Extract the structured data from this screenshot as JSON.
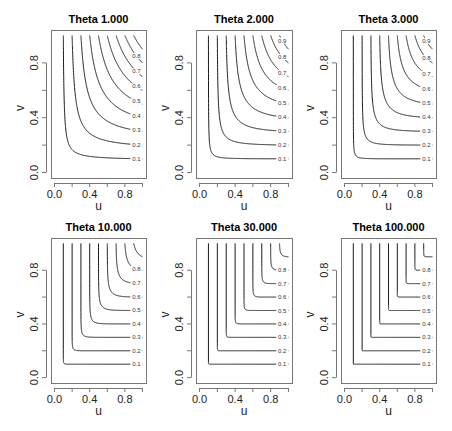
{
  "figure": {
    "width": 452,
    "height": 431,
    "line_color": "#1a1a1a",
    "frame_color": "#777777",
    "background": "#ffffff"
  },
  "chart_data": [
    {
      "type": "contour",
      "title": "Theta 1.000",
      "theta": 1,
      "xlabel": "u",
      "ylabel": "v",
      "xlim": [
        0,
        1
      ],
      "ylim": [
        0,
        1
      ],
      "xticks": [
        0.0,
        0.2,
        0.4,
        0.6,
        0.8,
        1.0
      ],
      "xtick_labels": [
        "0.0",
        "",
        "0.4",
        "",
        "0.8",
        ""
      ],
      "yticks": [
        0.0,
        0.2,
        0.4,
        0.6,
        0.8
      ],
      "ytick_labels": [
        "0.0",
        "",
        "0.4",
        "",
        "0.8"
      ],
      "levels": [
        0.1,
        0.2,
        0.3,
        0.4,
        0.5,
        0.6,
        0.7,
        0.8,
        0.9
      ],
      "level_labels": [
        "0.1",
        "0.2",
        "0.3",
        "0.4",
        "0.5",
        "0.6",
        "0.7",
        "0.8",
        ""
      ],
      "grid": false,
      "frame": {
        "x": 51,
        "y": 30,
        "w": 95,
        "h": 148
      }
    },
    {
      "type": "contour",
      "title": "Theta 2.000",
      "theta": 2,
      "xlabel": "u",
      "ylabel": "v",
      "xlim": [
        0,
        1
      ],
      "ylim": [
        0,
        1
      ],
      "xticks": [
        0.0,
        0.2,
        0.4,
        0.6,
        0.8,
        1.0
      ],
      "xtick_labels": [
        "0.0",
        "",
        "0.4",
        "",
        "0.8",
        ""
      ],
      "yticks": [
        0.0,
        0.2,
        0.4,
        0.6,
        0.8
      ],
      "ytick_labels": [
        "0.0",
        "",
        "0.4",
        "",
        "0.8"
      ],
      "levels": [
        0.1,
        0.2,
        0.3,
        0.4,
        0.5,
        0.6,
        0.7,
        0.8,
        0.9
      ],
      "level_labels": [
        "0.1",
        "0.2",
        "0.3",
        "0.4",
        "0.5",
        "0.6",
        "0.7",
        "0.8",
        "0.9"
      ],
      "grid": false,
      "frame": {
        "x": 196,
        "y": 30,
        "w": 96,
        "h": 148
      }
    },
    {
      "type": "contour",
      "title": "Theta 3.000",
      "theta": 3,
      "xlabel": "u",
      "ylabel": "v",
      "xlim": [
        0,
        1
      ],
      "ylim": [
        0,
        1
      ],
      "xticks": [
        0.0,
        0.2,
        0.4,
        0.6,
        0.8,
        1.0
      ],
      "xtick_labels": [
        "0.0",
        "",
        "0.4",
        "",
        "0.8",
        ""
      ],
      "yticks": [
        0.0,
        0.2,
        0.4,
        0.6,
        0.8
      ],
      "ytick_labels": [
        "0.0",
        "",
        "0.4",
        "",
        "0.8"
      ],
      "levels": [
        0.1,
        0.2,
        0.3,
        0.4,
        0.5,
        0.6,
        0.7,
        0.8,
        0.9
      ],
      "level_labels": [
        "0.1",
        "0.2",
        "0.3",
        "0.4",
        "0.5",
        "0.6",
        "0.7",
        "0.8",
        "0.9"
      ],
      "grid": false,
      "frame": {
        "x": 341,
        "y": 30,
        "w": 95,
        "h": 148
      }
    },
    {
      "type": "contour",
      "title": "Theta 10.000",
      "theta": 10,
      "xlabel": "u",
      "ylabel": "v",
      "xlim": [
        0,
        1
      ],
      "ylim": [
        0,
        1
      ],
      "xticks": [
        0.0,
        0.2,
        0.4,
        0.6,
        0.8,
        1.0
      ],
      "xtick_labels": [
        "0.0",
        "",
        "0.4",
        "",
        "0.8",
        ""
      ],
      "yticks": [
        0.0,
        0.2,
        0.4,
        0.6,
        0.8
      ],
      "ytick_labels": [
        "0.0",
        "",
        "0.4",
        "",
        "0.8"
      ],
      "levels": [
        0.1,
        0.2,
        0.3,
        0.4,
        0.5,
        0.6,
        0.7,
        0.8,
        0.9
      ],
      "level_labels": [
        "0.1",
        "0.2",
        "0.3",
        "0.4",
        "0.5",
        "0.6",
        "0.7",
        "0.8",
        ""
      ],
      "grid": false,
      "frame": {
        "x": 51,
        "y": 238,
        "w": 95,
        "h": 145
      }
    },
    {
      "type": "contour",
      "title": "Theta 30.000",
      "theta": 30,
      "xlabel": "u",
      "ylabel": "v",
      "xlim": [
        0,
        1
      ],
      "ylim": [
        0,
        1
      ],
      "xticks": [
        0.0,
        0.2,
        0.4,
        0.6,
        0.8,
        1.0
      ],
      "xtick_labels": [
        "0.0",
        "",
        "0.4",
        "",
        "0.8",
        ""
      ],
      "yticks": [
        0.0,
        0.2,
        0.4,
        0.6,
        0.8
      ],
      "ytick_labels": [
        "0.0",
        "",
        "0.4",
        "",
        "0.8"
      ],
      "levels": [
        0.1,
        0.2,
        0.3,
        0.4,
        0.5,
        0.6,
        0.7,
        0.8,
        0.9
      ],
      "level_labels": [
        "0.1",
        "0.2",
        "0.3",
        "0.4",
        "0.5",
        "0.6",
        "0.7",
        "0.8",
        ""
      ],
      "grid": false,
      "frame": {
        "x": 196,
        "y": 238,
        "w": 96,
        "h": 145
      }
    },
    {
      "type": "contour",
      "title": "Theta 100.000",
      "theta": 100,
      "xlabel": "u",
      "ylabel": "v",
      "xlim": [
        0,
        1
      ],
      "ylim": [
        0,
        1
      ],
      "xticks": [
        0.0,
        0.2,
        0.4,
        0.6,
        0.8,
        1.0
      ],
      "xtick_labels": [
        "0.0",
        "",
        "0.4",
        "",
        "0.8",
        ""
      ],
      "yticks": [
        0.0,
        0.2,
        0.4,
        0.6,
        0.8
      ],
      "ytick_labels": [
        "0.0",
        "",
        "0.4",
        "",
        "0.8"
      ],
      "levels": [
        0.1,
        0.2,
        0.3,
        0.4,
        0.5,
        0.6,
        0.7,
        0.8,
        0.9
      ],
      "level_labels": [
        "0.1",
        "0.2",
        "0.3",
        "0.4",
        "0.5",
        "0.6",
        "0.7",
        "0.8",
        ""
      ],
      "grid": false,
      "frame": {
        "x": 341,
        "y": 238,
        "w": 95,
        "h": 145
      }
    }
  ]
}
